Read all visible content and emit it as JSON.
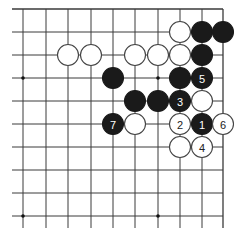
{
  "board": {
    "description": "Go diagram (top-right corner region)",
    "columns_x": [
      23,
      46,
      68,
      91,
      113,
      135,
      158,
      180,
      202,
      223
    ],
    "rows_y": [
      9,
      32,
      55,
      78,
      101,
      124,
      147,
      170,
      193,
      216
    ],
    "line_color": "#3a3a3a",
    "grid_left_x": 12,
    "grid_bottom_y": 228,
    "edges": [
      "top",
      "right"
    ],
    "star_points": [
      [
        0,
        3
      ],
      [
        6,
        3
      ],
      [
        0,
        9
      ],
      [
        6,
        9
      ]
    ],
    "stone_radius": 10.5,
    "black_color": "#1a1a1a",
    "white_color": "#ffffff",
    "stones": [
      {
        "col": 7,
        "row": 1,
        "color": "white",
        "label": ""
      },
      {
        "col": 8,
        "row": 1,
        "color": "black",
        "label": ""
      },
      {
        "col": 9,
        "row": 1,
        "color": "black",
        "label": ""
      },
      {
        "col": 2,
        "row": 2,
        "color": "white",
        "label": ""
      },
      {
        "col": 3,
        "row": 2,
        "color": "white",
        "label": ""
      },
      {
        "col": 5,
        "row": 2,
        "color": "white",
        "label": ""
      },
      {
        "col": 6,
        "row": 2,
        "color": "white",
        "label": ""
      },
      {
        "col": 7,
        "row": 2,
        "color": "white",
        "label": ""
      },
      {
        "col": 8,
        "row": 2,
        "color": "black",
        "label": ""
      },
      {
        "col": 4,
        "row": 3,
        "color": "black",
        "label": ""
      },
      {
        "col": 7,
        "row": 3,
        "color": "black",
        "label": ""
      },
      {
        "col": 8,
        "row": 3,
        "color": "black",
        "label": "5"
      },
      {
        "col": 5,
        "row": 4,
        "color": "black",
        "label": ""
      },
      {
        "col": 6,
        "row": 4,
        "color": "black",
        "label": ""
      },
      {
        "col": 7,
        "row": 4,
        "color": "black",
        "label": "3"
      },
      {
        "col": 8,
        "row": 4,
        "color": "white",
        "label": ""
      },
      {
        "col": 4,
        "row": 5,
        "color": "black",
        "label": "7"
      },
      {
        "col": 5,
        "row": 5,
        "color": "white",
        "label": ""
      },
      {
        "col": 7,
        "row": 5,
        "color": "white",
        "label": "2"
      },
      {
        "col": 8,
        "row": 5,
        "color": "black",
        "label": "1"
      },
      {
        "col": 9,
        "row": 5,
        "color": "white",
        "label": "6"
      },
      {
        "col": 7,
        "row": 6,
        "color": "white",
        "label": ""
      },
      {
        "col": 8,
        "row": 6,
        "color": "white",
        "label": "4"
      }
    ]
  }
}
